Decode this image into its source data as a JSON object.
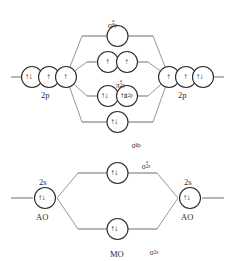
{
  "colors": {
    "line": "#4a4a4a",
    "circle_stroke": "#2b2b2b",
    "text": "#2b2b2b",
    "background": "#ffffff"
  },
  "labels": {
    "left_2p": "2p",
    "right_2p": "2p",
    "left_2s": "2s",
    "right_2s": "2s",
    "left_ao": "AO",
    "right_ao": "AO",
    "mo": "MO",
    "sigma_2px_anti": {
      "base": "σ",
      "star": "*",
      "sub": "2p",
      "subx": "x"
    },
    "pi_2p_anti": {
      "base": "π",
      "star": "*",
      "sub": "2p"
    },
    "pi_2p": {
      "base": "π",
      "sub": "2p"
    },
    "sigma_2px": {
      "base": "σ",
      "sub": "2p",
      "subx": "x"
    },
    "sigma_2s_anti": {
      "base": "σ",
      "star": "*",
      "sub": "2s"
    },
    "sigma_2s": {
      "base": "σ",
      "sub": "2s"
    }
  },
  "electrons": {
    "pair": "↑↓",
    "single": "↑",
    "empty": ""
  },
  "orbitals": {
    "left_2p": [
      {
        "name": "left-2p-orbital-1",
        "fill": "pair"
      },
      {
        "name": "left-2p-orbital-2",
        "fill": "single"
      },
      {
        "name": "left-2p-orbital-3",
        "fill": "single"
      }
    ],
    "right_2p": [
      {
        "name": "right-2p-orbital-1",
        "fill": "single"
      },
      {
        "name": "right-2p-orbital-2",
        "fill": "single"
      },
      {
        "name": "right-2p-orbital-3",
        "fill": "pair"
      }
    ],
    "sigma_2px_anti": {
      "fill": "empty"
    },
    "pi_2p_anti": [
      {
        "name": "pi-antibonding-orbital-1",
        "fill": "single"
      },
      {
        "name": "pi-antibonding-orbital-2",
        "fill": "single"
      }
    ],
    "pi_2p": [
      {
        "name": "pi-bonding-orbital-1",
        "fill": "pair"
      },
      {
        "name": "pi-bonding-orbital-2",
        "fill": "pair"
      }
    ],
    "sigma_2px": {
      "fill": "pair"
    },
    "sigma_2s_anti": {
      "fill": "pair"
    },
    "sigma_2s": {
      "fill": "pair"
    },
    "left_2s": {
      "fill": "pair"
    },
    "right_2s": {
      "fill": "pair"
    }
  }
}
